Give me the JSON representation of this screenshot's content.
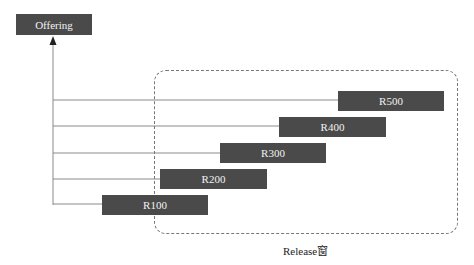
{
  "diagram": {
    "root": {
      "label": "Offering"
    },
    "releases": [
      {
        "label": "R500"
      },
      {
        "label": "R400"
      },
      {
        "label": "R300"
      },
      {
        "label": "R200"
      },
      {
        "label": "R100"
      }
    ],
    "window_caption": "Release窗"
  },
  "colors": {
    "box_fill": "#4a4a4a",
    "box_text": "#f2f2f2",
    "line": "#8a8a8a",
    "window_border": "#777777"
  }
}
